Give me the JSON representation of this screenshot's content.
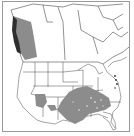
{
  "map": {
    "type": "species-range-map",
    "region": "North America",
    "legend": null,
    "title": null,
    "colors": {
      "background": "#ffffff",
      "frame": "#9a9a9a",
      "boundaries": "#4a4a4a",
      "range_fill": "#8c8c8c",
      "range_dense": "#2e2e2e"
    },
    "range_areas": [
      {
        "name": "pacific-northwest-british-columbia",
        "shade": "medium-gray",
        "coastal_band": "dark"
      },
      {
        "name": "arizona-new-mexico",
        "shade": "medium-gray"
      },
      {
        "name": "southeastern-united-states",
        "shade": "medium-gray",
        "pattern": "speckled"
      },
      {
        "name": "mid-atlantic-coast",
        "shade": "dark",
        "pattern": "dots"
      }
    ]
  }
}
